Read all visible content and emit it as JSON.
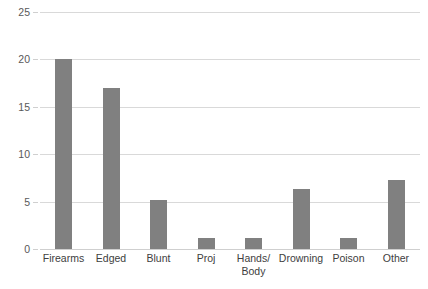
{
  "chart_data": {
    "type": "bar",
    "title": "",
    "subtitle": "",
    "xlabel": "",
    "ylabel": "",
    "categories": [
      "Firearms",
      "Edged",
      "Blunt",
      "Proj",
      "Hands/\nBody",
      "Drowning",
      "Poison",
      "Other"
    ],
    "values": [
      20.0,
      17.0,
      5.2,
      1.2,
      1.2,
      6.3,
      1.2,
      7.3
    ],
    "ylim": [
      0,
      25
    ],
    "yticks": [
      0,
      5,
      10,
      15,
      20,
      25
    ],
    "ytick_labels": [
      "0",
      "5",
      "10",
      "15",
      "20",
      "25"
    ],
    "grid": true,
    "grid_axis": "y",
    "legend": false,
    "legend_position": "none",
    "series": [
      {
        "name": "",
        "values": [
          20.0,
          17.0,
          5.2,
          1.2,
          1.2,
          6.3,
          1.2,
          7.3
        ]
      }
    ],
    "colors": {
      "bar": "#808080",
      "gridline": "#d9d9d9",
      "baseline": "#cfcfcf",
      "tick_label": "#595959",
      "category_label": "#404040",
      "background": "#ffffff"
    }
  }
}
